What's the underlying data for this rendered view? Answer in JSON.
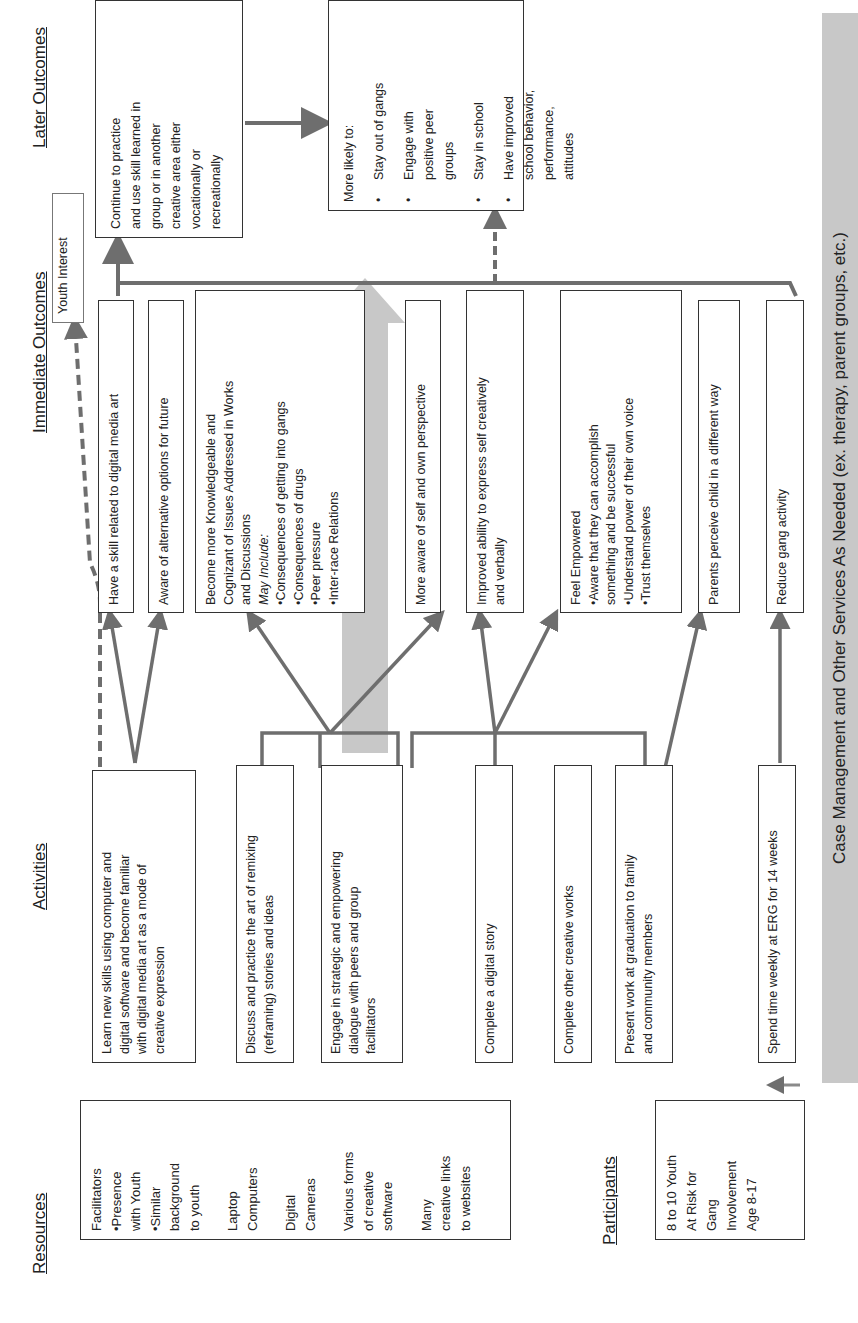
{
  "headers": {
    "resources": "Resources",
    "activities": "Activities",
    "immediate_outcomes": "Immediate Outcomes",
    "later_outcomes": "Later Outcomes",
    "participants": "Participants"
  },
  "resources": {
    "lines": [
      "Facilitators",
      "•Presence",
      "with Youth",
      "•Similar",
      "background",
      "to youth",
      "",
      "Laptop",
      "Computers",
      "",
      "Digital",
      "Cameras",
      "",
      "Various forms",
      "of creative",
      "software",
      "",
      "Many",
      "creative links",
      "to websites"
    ]
  },
  "participants": {
    "lines": [
      "8 to 10 Youth",
      "At Risk for",
      "Gang",
      "Involvement",
      "Age 8-17"
    ]
  },
  "activities": [
    {
      "id": "learn",
      "lines": [
        "Learn new skills using computer and",
        "digital software and become familiar",
        "with digital media art as a mode of",
        "creative expression"
      ]
    },
    {
      "id": "remix",
      "lines": [
        "Discuss and practice the art of remixing",
        "(reframing) stories and ideas"
      ]
    },
    {
      "id": "dialogue",
      "lines": [
        "Engage in strategic and empowering",
        "dialogue with peers and group",
        "facilitators"
      ]
    },
    {
      "id": "story",
      "lines": [
        "Complete a digital story"
      ]
    },
    {
      "id": "other",
      "lines": [
        "Complete other creative works"
      ]
    },
    {
      "id": "present",
      "lines": [
        "Present work at graduation to family",
        "and community members"
      ]
    },
    {
      "id": "spend",
      "lines": [
        "Spend time weekly at ERG for 14 weeks"
      ]
    }
  ],
  "immediate_outcomes": [
    {
      "id": "skill",
      "lines": [
        "Have a skill related to digital media art"
      ]
    },
    {
      "id": "aware",
      "lines": [
        "Aware of alternative options for future"
      ]
    },
    {
      "id": "knowledge",
      "lines": [
        "Become more Knowledgeable and",
        "Cognizant of Issues Addressed in Works",
        "and Discussions"
      ],
      "italic": "May Include:",
      "bullets": [
        "•Consequences of getting into gangs",
        "•Consequences of drugs",
        "•Peer pressure",
        "•Inter-race Relations"
      ]
    },
    {
      "id": "self",
      "lines": [
        "More aware of self and own perspective"
      ]
    },
    {
      "id": "express",
      "lines": [
        "Improved ability to express self creatively",
        "and verbally"
      ]
    },
    {
      "id": "empower",
      "lines": [
        "Feel Empowered",
        "•Aware that they can accomplish",
        "something and be successful",
        "•Understand power of their own voice",
        "•Trust themselves"
      ]
    },
    {
      "id": "parents",
      "lines": [
        "Parents perceive child in a different way"
      ]
    },
    {
      "id": "gang",
      "lines": [
        "Reduce gang activity"
      ]
    }
  ],
  "youth_interest": "Youth Interest",
  "later_outcomes": {
    "continue": [
      "Continue to practice",
      "and use skill learned in",
      "group or in another",
      "creative area either",
      "vocationally or",
      "recreationally"
    ],
    "likely_title": "More likely to:",
    "likely_items": [
      [
        "Stay out of gangs"
      ],
      [
        "Engage with",
        "positive peer",
        "groups"
      ],
      [
        "Stay in school"
      ],
      [
        "Have improved",
        "school behavior,",
        "performance,",
        "attitudes"
      ]
    ]
  },
  "case_management": "Case Management and Other Services As Needed (ex. therapy, parent groups, etc.)",
  "colors": {
    "arrow": "#6e6e6e",
    "band": "#c8c8c8",
    "border": "#333333"
  }
}
